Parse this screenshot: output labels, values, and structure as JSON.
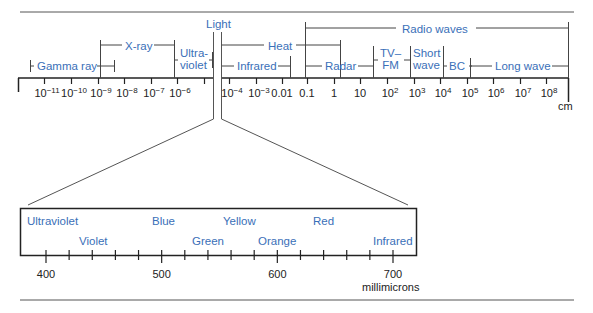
{
  "top_spectrum": {
    "unit": "cm",
    "ticks": [
      {
        "x": 44,
        "base": "10",
        "exp": "−11"
      },
      {
        "x": 71,
        "base": "10",
        "exp": "−10"
      },
      {
        "x": 98,
        "base": "10",
        "exp": "−9"
      },
      {
        "x": 124,
        "base": "10",
        "exp": "−8"
      },
      {
        "x": 151,
        "base": "10",
        "exp": "−7"
      },
      {
        "x": 177,
        "base": "10",
        "exp": "−6"
      },
      {
        "x": 204,
        "base": "",
        "exp": ""
      },
      {
        "x": 229,
        "base": "10",
        "exp": "−4"
      },
      {
        "x": 256,
        "base": "10",
        "exp": "−3"
      },
      {
        "x": 282,
        "base": "0.01",
        "exp": ""
      },
      {
        "x": 307,
        "base": "0.1",
        "exp": ""
      },
      {
        "x": 334,
        "base": "1",
        "exp": ""
      },
      {
        "x": 360,
        "base": "10",
        "exp": ""
      },
      {
        "x": 387,
        "base": "10",
        "exp": "2"
      },
      {
        "x": 414,
        "base": "10",
        "exp": "3"
      },
      {
        "x": 440,
        "base": "10",
        "exp": "4"
      },
      {
        "x": 467,
        "base": "10",
        "exp": "5"
      },
      {
        "x": 493,
        "base": "10",
        "exp": "6"
      },
      {
        "x": 520,
        "base": "10",
        "exp": "7"
      },
      {
        "x": 546,
        "base": "10",
        "exp": "8"
      }
    ],
    "bands": {
      "light": "Light",
      "radio_waves": "Radio waves",
      "x_ray": "X-ray",
      "heat": "Heat",
      "tv_fm_line1": "TV–",
      "tv_fm_line2": "FM",
      "short_wave_line1": "Short",
      "short_wave_line2": "wave",
      "gamma_ray": "Gamma ray",
      "ultraviolet_line1": "Ultra-",
      "ultraviolet_line2": "violet",
      "infrared": "Infrared",
      "radar": "Radar",
      "bc": "BC",
      "long_wave": "Long wave"
    }
  },
  "visible_spectrum": {
    "unit": "millimicrons",
    "ticks": [
      {
        "value": 400,
        "label": "400"
      },
      {
        "value": 500,
        "label": "500"
      },
      {
        "value": 600,
        "label": "600"
      },
      {
        "value": 700,
        "label": "700"
      }
    ],
    "colors": {
      "ultraviolet": "Ultraviolet",
      "violet": "Violet",
      "blue": "Blue",
      "green": "Green",
      "yellow": "Yellow",
      "orange": "Orange",
      "red": "Red",
      "infrared": "Infrared"
    }
  },
  "style": {
    "label_color": "#3a6fb8",
    "line_color": "#222222"
  }
}
